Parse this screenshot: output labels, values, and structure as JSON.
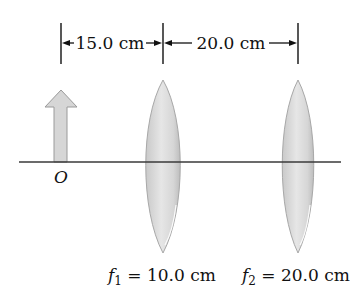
{
  "diagram": {
    "dimensions": {
      "d1_label": "15.0 cm",
      "d2_label": "20.0 cm"
    },
    "object": {
      "label": "O"
    },
    "lenses": [
      {
        "name": "f",
        "sub": "1",
        "eq": " = 10.0 cm"
      },
      {
        "name": "f",
        "sub": "2",
        "eq": " = 20.0 cm"
      }
    ],
    "colors": {
      "axis": "#3a3a3a",
      "lens_fill": "#d8d8d8",
      "lens_edge": "#a8a8a8",
      "arrow_fill": "#d4d4d4",
      "arrow_edge": "#9a9a9a",
      "text": "#111111"
    }
  }
}
